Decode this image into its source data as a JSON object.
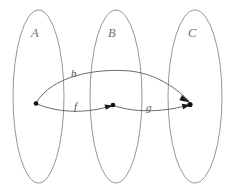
{
  "figure": {
    "kind": "function-composition-diagram",
    "width": 234,
    "height": 196,
    "background_color": "#ffffff",
    "ellipse_stroke_color": "#8a8a8a",
    "curve_stroke_color": "#5a5a5a",
    "dot_color": "#111111",
    "set_label_color": "#6e6e6e",
    "map_label_color": "#555555"
  },
  "sets": [
    {
      "id": "A",
      "label": "A",
      "label_x": 31,
      "label_y": 37,
      "cx": 38.5,
      "cy": 96.5,
      "rx": 25.5,
      "ry": 86.5
    },
    {
      "id": "B",
      "label": "B",
      "label_x": 108,
      "label_y": 37,
      "cx": 116,
      "cy": 96.5,
      "rx": 26,
      "ry": 86.5
    },
    {
      "id": "C",
      "label": "C",
      "label_x": 188,
      "label_y": 37,
      "cx": 195,
      "cy": 96.5,
      "rx": 27,
      "ry": 86.5
    }
  ],
  "elements": [
    {
      "id": "a",
      "set": "A",
      "x": 36,
      "y": 103.5,
      "r": 2.3
    },
    {
      "id": "b",
      "set": "B",
      "x": 113,
      "y": 105,
      "r": 2.3
    },
    {
      "id": "c",
      "set": "C",
      "x": 190,
      "y": 104.5,
      "r": 2.6
    }
  ],
  "morphisms": [
    {
      "id": "f",
      "label": "f",
      "from": "a",
      "to": "b",
      "label_x": 74,
      "label_y": 110,
      "path": "M 36 103.5 C 60 114, 90 113, 112 105.5"
    },
    {
      "id": "g",
      "label": "g",
      "from": "b",
      "to": "c",
      "label_x": 146,
      "label_y": 111,
      "path": "M 113.5 105.5 C 138 114, 168 111, 189 105"
    },
    {
      "id": "h",
      "label": "h",
      "from": "a",
      "to": "c",
      "label_x": 71,
      "label_y": 77,
      "path": "M 36 103 C 52 76, 95 68, 130 71 C 158 74, 178 90, 189 101"
    }
  ],
  "arrowheads": [
    {
      "for": "f",
      "tip_x": 113,
      "tip_y": 105.5,
      "angle_deg": -14
    },
    {
      "for": "g",
      "tip_x": 190.5,
      "tip_y": 105,
      "angle_deg": -13
    },
    {
      "for": "h",
      "tip_x": 190,
      "tip_y": 102,
      "angle_deg": 40
    }
  ]
}
